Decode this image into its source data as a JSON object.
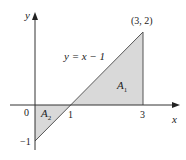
{
  "figure": {
    "axes": {
      "x_label": "x",
      "y_label": "y",
      "origin_label": "0",
      "x_ticks": [
        "1",
        "3"
      ],
      "y_ticks": [
        "−1"
      ]
    },
    "line": {
      "equation_label": "y = x − 1",
      "point_label": "(3, 2)"
    },
    "regions": [
      {
        "name": "A",
        "subscript": "1"
      },
      {
        "name": "A",
        "subscript": "2"
      }
    ],
    "colors": {
      "fill": "#d9d9d9",
      "stroke": "#444444",
      "axis": "#333333"
    }
  }
}
